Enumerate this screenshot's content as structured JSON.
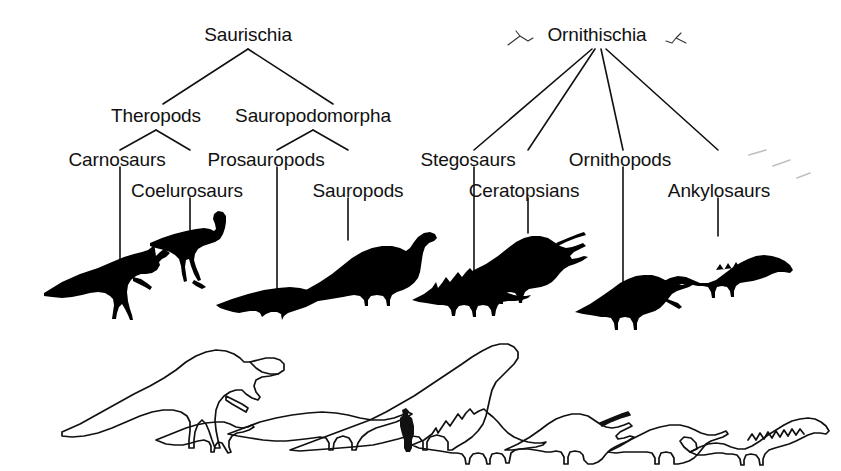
{
  "diagram": {
    "background_color": "#ffffff",
    "ink_color": "#111111",
    "faint_color": "#b8b8b8"
  },
  "nodes": {
    "saurischia": {
      "label": "Saurischia",
      "x": 248,
      "y": 34
    },
    "ornithischia": {
      "label": "Ornithischia",
      "x": 597,
      "y": 34
    },
    "theropods": {
      "label": "Theropods",
      "x": 156,
      "y": 115
    },
    "sauropodomorpha": {
      "label": "Sauropodomorpha",
      "x": 313,
      "y": 115
    },
    "carnosaurs": {
      "label": "Carnosaurs",
      "x": 117,
      "y": 159
    },
    "coelurosaurs": {
      "label": "Coelurosaurs",
      "x": 187,
      "y": 190
    },
    "prosauropods": {
      "label": "Prosauropods",
      "x": 266,
      "y": 159
    },
    "sauropods": {
      "label": "Sauropods",
      "x": 358,
      "y": 190
    },
    "stegosaurs": {
      "label": "Stegosaurs",
      "x": 468,
      "y": 159
    },
    "ceratopsians": {
      "label": "Ceratopsians",
      "x": 524,
      "y": 190
    },
    "ornithopods": {
      "label": "Ornithopods",
      "x": 620,
      "y": 159
    },
    "ankylosaurs": {
      "label": "Ankylosaurs",
      "x": 719,
      "y": 190
    }
  },
  "clade_order": [
    "saurischia",
    "ornithischia",
    "theropods",
    "sauropodomorpha",
    "carnosaurs",
    "coelurosaurs",
    "prosauropods",
    "sauropods",
    "stegosaurs",
    "ceratopsians",
    "ornithopods",
    "ankylosaurs"
  ],
  "silhouettes": {
    "row_label": "Filled black silhouettes of representative dinosaurs",
    "items": [
      {
        "name": "carnosaur-silhouette",
        "clade": "Carnosaurs"
      },
      {
        "name": "coelurosaur-silhouette",
        "clade": "Coelurosaurs"
      },
      {
        "name": "prosauropod-silhouette",
        "clade": "Prosauropods"
      },
      {
        "name": "sauropod-silhouette",
        "clade": "Sauropods"
      },
      {
        "name": "stegosaur-silhouette",
        "clade": "Stegosaurs"
      },
      {
        "name": "ceratopsian-silhouette",
        "clade": "Ceratopsians"
      },
      {
        "name": "ornithopod-silhouette",
        "clade": "Ornithopods"
      },
      {
        "name": "ankylosaur-silhouette",
        "clade": "Ankylosaurs"
      }
    ]
  },
  "scale_row": {
    "row_label": "Outline size-comparison row with human figure for scale",
    "items": [
      {
        "name": "tyrannosaur-outline",
        "clade": "Carnosaurs"
      },
      {
        "name": "small-theropod-outline",
        "clade": "Coelurosaurs"
      },
      {
        "name": "prosauropod-outline",
        "clade": "Prosauropods"
      },
      {
        "name": "sauropod-outline",
        "clade": "Sauropods"
      },
      {
        "name": "human-scale-figure",
        "clade": "Human"
      },
      {
        "name": "stegosaur-outline",
        "clade": "Stegosaurs"
      },
      {
        "name": "ceratopsian-outline",
        "clade": "Ceratopsians"
      },
      {
        "name": "ornithopod-outline",
        "clade": "Ornithopods"
      },
      {
        "name": "ankylosaur-outline",
        "clade": "Ankylosaurs"
      }
    ]
  },
  "marks": {
    "left_bird_glyph": "bird-glyph-left",
    "right_bird_glyph": "bird-glyph-right",
    "faint_dashes": "faint-dashed-strokes"
  }
}
